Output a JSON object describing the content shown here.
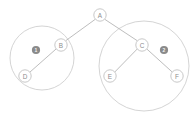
{
  "diagram": {
    "type": "binary-tree",
    "title": "",
    "canvas": {
      "width": 194,
      "height": 113,
      "background": "#ffffff"
    },
    "colors": {
      "node_stroke": "#c2c2c2",
      "node_fill": "#ffffff",
      "node_text": "#8d8d8d",
      "edge": "#b5b5b5",
      "group_circle": "#cfcfcf",
      "badge_fill": "#8a8a8a",
      "badge_text": "#f4f4f4"
    },
    "nodes": [
      {
        "id": "A",
        "label": "A",
        "cx": 100,
        "cy": 15,
        "r": 6.2
      },
      {
        "id": "B",
        "label": "B",
        "cx": 61,
        "cy": 45,
        "r": 6.2
      },
      {
        "id": "C",
        "label": "C",
        "cx": 142,
        "cy": 45,
        "r": 6.2
      },
      {
        "id": "D",
        "label": "D",
        "cx": 25,
        "cy": 76,
        "r": 6.2
      },
      {
        "id": "E",
        "label": "E",
        "cx": 110,
        "cy": 76,
        "r": 6.2
      },
      {
        "id": "F",
        "label": "F",
        "cx": 177,
        "cy": 76,
        "r": 6.2
      }
    ],
    "edges": [
      {
        "from": "A",
        "to": "B",
        "x1": 95.4,
        "y1": 19.2,
        "x2": 65.6,
        "y2": 40.8
      },
      {
        "from": "A",
        "to": "C",
        "x1": 104.6,
        "y1": 19.2,
        "x2": 137.4,
        "y2": 40.8
      },
      {
        "from": "B",
        "to": "D",
        "x1": 56.5,
        "y1": 48.6,
        "x2": 29.6,
        "y2": 72.4
      },
      {
        "from": "C",
        "to": "E",
        "x1": 137.4,
        "y1": 48.8,
        "x2": 114.6,
        "y2": 72.2
      },
      {
        "from": "C",
        "to": "F",
        "x1": 146.6,
        "y1": 48.8,
        "x2": 172.4,
        "y2": 72.2
      }
    ],
    "groups": [
      {
        "id": "subtree-1",
        "cx": 42,
        "cy": 58,
        "r": 32,
        "contains": [
          "B",
          "D"
        ]
      },
      {
        "id": "subtree-2",
        "cx": 144,
        "cy": 66,
        "r": 45,
        "contains": [
          "C",
          "E",
          "F"
        ]
      }
    ],
    "badges": [
      {
        "id": "badge-1",
        "label": "1",
        "cx": 36,
        "cy": 50,
        "r": 4.1
      },
      {
        "id": "badge-2",
        "label": "2",
        "cx": 164,
        "cy": 50,
        "r": 4.1
      }
    ]
  }
}
